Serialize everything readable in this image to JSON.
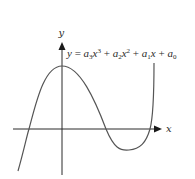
{
  "figure": {
    "x_axis_label": "x",
    "y_axis_label": "y",
    "equation": {
      "lhs": "y",
      "eq": " = ",
      "terms": [
        {
          "coef": "a",
          "sub": "3",
          "var": "x",
          "sup": "3"
        },
        {
          "coef": "a",
          "sub": "2",
          "var": "x",
          "sup": "2"
        },
        {
          "coef": "a",
          "sub": "1",
          "var": "x",
          "sup": ""
        },
        {
          "coef": "a",
          "sub": "0",
          "var": "",
          "sup": ""
        }
      ],
      "plus": " + ",
      "full_text": "y = a3x^3 + a2x^2 + a1x + a0"
    },
    "colors": {
      "curve": "#555555",
      "axes": "#2a2a2a",
      "background": "#ffffff"
    }
  }
}
